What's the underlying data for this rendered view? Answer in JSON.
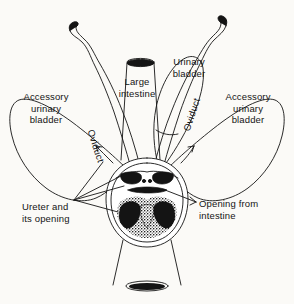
{
  "figure": {
    "background_color": "#fbfaf7",
    "ink_color": "#141414",
    "width": 294,
    "height": 304
  },
  "labels": {
    "accessory_urinary_bladder_left": "Accessory\nurinary\nbladder",
    "accessory_urinary_bladder_right": "Accessory\nurinary\nbladder",
    "large_intestine": "Large\nintestine",
    "urinary_bladder": "Urinary\nbladder",
    "oviduct_left": "Oviduct",
    "oviduct_right": "Oviduct",
    "ureter": "Ureter and\nits opening",
    "opening_from_intestine": "Opening from\nintestine"
  },
  "structures": [
    {
      "name": "large-intestine",
      "kind": "tube",
      "opening": "black-ellipse-top"
    },
    {
      "name": "urinary-bladder",
      "kind": "sac"
    },
    {
      "name": "accessory-urinary-bladder-left",
      "kind": "sac"
    },
    {
      "name": "accessory-urinary-bladder-right",
      "kind": "sac"
    },
    {
      "name": "oviduct-left",
      "kind": "wavy-tube",
      "tip": "black-cap"
    },
    {
      "name": "oviduct-right",
      "kind": "wavy-tube",
      "tip": "black-cap"
    },
    {
      "name": "cloaca",
      "kind": "chamber",
      "interior": "stippled-black"
    },
    {
      "name": "ureter-opening-left",
      "kind": "black-slit"
    },
    {
      "name": "ureter-opening-right",
      "kind": "black-slit"
    },
    {
      "name": "intestinal-opening",
      "kind": "black-bar"
    },
    {
      "name": "vent",
      "kind": "black-ellipse"
    }
  ]
}
